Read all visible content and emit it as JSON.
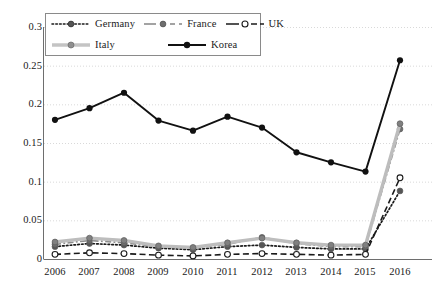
{
  "chart_data": {
    "type": "line",
    "title": "",
    "subtitle": "",
    "xlabel": "",
    "ylabel": "",
    "categories": [
      "2006",
      "2007",
      "2008",
      "2009",
      "2010",
      "2011",
      "2012",
      "2013",
      "2014",
      "2015",
      "2016"
    ],
    "x": [
      2006,
      2007,
      2008,
      2009,
      2010,
      2011,
      2012,
      2013,
      2014,
      2015,
      2016
    ],
    "ylim": [
      0,
      0.3
    ],
    "xlim": [
      2006,
      2016
    ],
    "y_ticks": [
      0,
      0.05,
      0.1,
      0.15,
      0.2,
      0.25,
      0.3
    ],
    "y_tick_labels": [
      "0",
      "0.05",
      "0.1",
      "0.15",
      "0.2",
      "0.25",
      "0.3"
    ],
    "grid": "horizontal-dotted",
    "legend_position": "top-left-inside",
    "series": [
      {
        "name": "Germany",
        "style": "dotted",
        "color": "#1a1a1a",
        "marker": "filled-circle",
        "marker_color": "#555555",
        "values": [
          0.016,
          0.02,
          0.018,
          0.014,
          0.012,
          0.016,
          0.018,
          0.015,
          0.013,
          0.013,
          0.088
        ]
      },
      {
        "name": "France",
        "style": "dash-dot",
        "color": "#8c8c8c",
        "marker": "filled-circle",
        "marker_color": "#6e6e6e",
        "values": [
          0.019,
          0.024,
          0.021,
          0.016,
          0.014,
          0.019,
          0.028,
          0.02,
          0.016,
          0.016,
          0.168
        ]
      },
      {
        "name": "UK",
        "style": "dashed",
        "color": "#1a1a1a",
        "marker": "open-circle",
        "marker_color": "#1a1a1a",
        "values": [
          0.006,
          0.008,
          0.007,
          0.005,
          0.004,
          0.006,
          0.007,
          0.006,
          0.005,
          0.006,
          0.105
        ]
      },
      {
        "name": "Italy",
        "style": "solid-thick-light",
        "color": "#bdbdbd",
        "marker": "filled-circle",
        "marker_color": "#808080",
        "values": [
          0.022,
          0.027,
          0.024,
          0.017,
          0.015,
          0.021,
          0.027,
          0.021,
          0.018,
          0.018,
          0.175
        ]
      },
      {
        "name": "Korea",
        "style": "solid",
        "color": "#111111",
        "marker": "filled-circle",
        "marker_color": "#111111",
        "values": [
          0.18,
          0.195,
          0.215,
          0.179,
          0.166,
          0.184,
          0.17,
          0.138,
          0.125,
          0.113,
          0.257
        ]
      }
    ]
  },
  "axes": {
    "y_labels": [
      "0.3",
      "0.25",
      "0.2",
      "0.15",
      "0.1",
      "0.05",
      "0"
    ],
    "x_labels": [
      "2006",
      "2007",
      "2008",
      "2009",
      "2010",
      "2011",
      "2012",
      "2013",
      "2014",
      "2015",
      "2016"
    ]
  },
  "legend": {
    "items": [
      {
        "label": "Germany"
      },
      {
        "label": "France"
      },
      {
        "label": "UK"
      },
      {
        "label": "Italy"
      },
      {
        "label": "Korea"
      }
    ]
  }
}
